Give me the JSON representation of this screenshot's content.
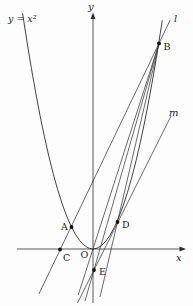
{
  "figure": {
    "equation_label": "y = x²",
    "axes": {
      "x_label": "x",
      "y_label": "y"
    },
    "lines": {
      "l_label": "l",
      "m_label": "m"
    },
    "points": {
      "A": "A",
      "B": "B",
      "C": "C",
      "D": "D",
      "E": "E",
      "O": "O"
    },
    "colors": {
      "stroke": "#2e2e2e",
      "background": "#fdfdfd"
    }
  }
}
